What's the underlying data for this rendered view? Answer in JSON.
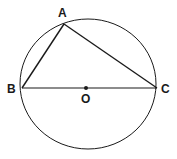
{
  "diagram": {
    "stroke_color": "#1a1a1a",
    "background": "#ffffff",
    "circle": {
      "cx": 87,
      "cy": 84,
      "rx": 68,
      "ry": 65,
      "label": "circle"
    },
    "points": {
      "A": {
        "label": "A",
        "x": 64,
        "y": 24,
        "label_x": 58,
        "label_y": 17
      },
      "B": {
        "label": "B",
        "x": 22,
        "y": 88,
        "label_x": 8,
        "label_y": 97
      },
      "C": {
        "label": "C",
        "x": 157,
        "y": 88,
        "label_x": 160,
        "label_y": 97
      },
      "O": {
        "label": "O",
        "x": 86,
        "y": 88,
        "label_x": 81,
        "label_y": 103
      }
    },
    "segments": [
      "AB",
      "AC",
      "BC"
    ]
  }
}
